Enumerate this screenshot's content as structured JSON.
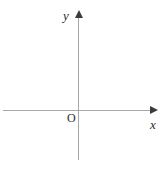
{
  "figure": {
    "background_color": "#ffffff",
    "axis_color": "#a8a8a8",
    "arrow_color": "#3c3c3c",
    "label_color": "#2b2b2b"
  },
  "chart_data": {
    "type": "scatter",
    "title": "",
    "subtitle": "",
    "xlabel": "x",
    "ylabel": "y",
    "origin_label": "O",
    "series": [],
    "x": [],
    "values": [],
    "categories": [],
    "tick_labels": {
      "x": [],
      "y": []
    },
    "annotations": [],
    "legend": {
      "entries": [],
      "position": "none"
    },
    "grid": false,
    "xlim": [
      -1.6,
      1.6
    ],
    "ylim": [
      -1.6,
      1.6
    ]
  }
}
